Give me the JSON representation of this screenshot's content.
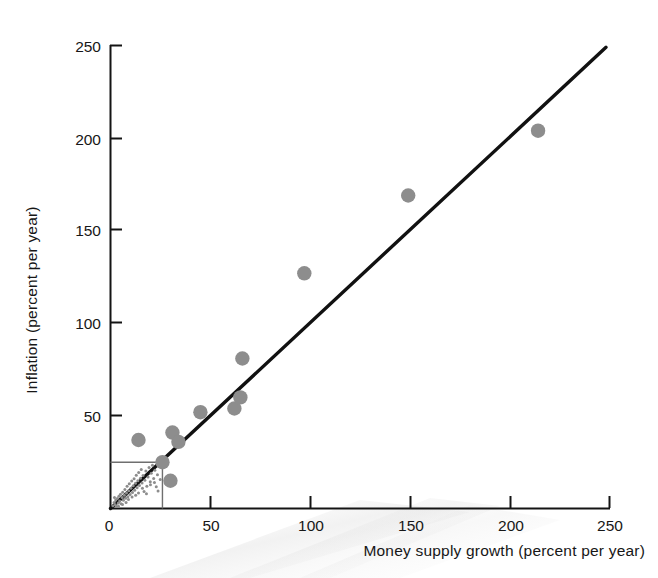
{
  "chart_data": {
    "type": "scatter",
    "title": "",
    "xlabel": "Money supply growth (percent per year)",
    "ylabel": "Inflation (percent per year)",
    "xlim": [
      0,
      250
    ],
    "ylim": [
      0,
      250
    ],
    "xticks": [
      0,
      50,
      100,
      150,
      200,
      250
    ],
    "yticks": [
      0,
      50,
      100,
      150,
      200,
      250
    ],
    "xtick_labels": [
      "0",
      "50",
      "100",
      "150",
      "200",
      "250"
    ],
    "ytick_labels": [
      "0",
      "50",
      "100",
      "150",
      "200",
      "250"
    ],
    "grid": false,
    "legend": "none",
    "series": [
      {
        "name": "Countries (large markers)",
        "marker": "circle",
        "color": "#8d8d8d",
        "points": [
          {
            "x": 14,
            "y": 37
          },
          {
            "x": 26,
            "y": 25
          },
          {
            "x": 30,
            "y": 15
          },
          {
            "x": 31,
            "y": 41
          },
          {
            "x": 34,
            "y": 36
          },
          {
            "x": 45,
            "y": 52
          },
          {
            "x": 62,
            "y": 54
          },
          {
            "x": 65,
            "y": 60
          },
          {
            "x": 66,
            "y": 81
          },
          {
            "x": 97,
            "y": 127
          },
          {
            "x": 149,
            "y": 169
          },
          {
            "x": 214,
            "y": 204
          }
        ]
      },
      {
        "name": "Inset cluster (small markers)",
        "marker": "small-dot",
        "color": "#8d8d8d",
        "points": [
          {
            "x": 1.2,
            "y": 1.5
          },
          {
            "x": 1.8,
            "y": 3.2
          },
          {
            "x": 2.4,
            "y": 2.0
          },
          {
            "x": 2.6,
            "y": 4.6
          },
          {
            "x": 3.1,
            "y": 1.1
          },
          {
            "x": 3.4,
            "y": 5.4
          },
          {
            "x": 3.9,
            "y": 3.0
          },
          {
            "x": 4.2,
            "y": 6.6
          },
          {
            "x": 4.6,
            "y": 4.1
          },
          {
            "x": 5.0,
            "y": 7.7
          },
          {
            "x": 5.3,
            "y": 2.6
          },
          {
            "x": 5.8,
            "y": 5.9
          },
          {
            "x": 6.1,
            "y": 8.8
          },
          {
            "x": 6.5,
            "y": 4.4
          },
          {
            "x": 6.9,
            "y": 7.1
          },
          {
            "x": 7.2,
            "y": 10.2
          },
          {
            "x": 7.6,
            "y": 5.6
          },
          {
            "x": 8.0,
            "y": 8.4
          },
          {
            "x": 8.3,
            "y": 12.0
          },
          {
            "x": 8.7,
            "y": 6.4
          },
          {
            "x": 9.1,
            "y": 9.6
          },
          {
            "x": 9.4,
            "y": 13.4
          },
          {
            "x": 9.8,
            "y": 7.5
          },
          {
            "x": 10.2,
            "y": 11.0
          },
          {
            "x": 10.6,
            "y": 14.8
          },
          {
            "x": 11.0,
            "y": 8.6
          },
          {
            "x": 11.4,
            "y": 12.3
          },
          {
            "x": 11.8,
            "y": 16.1
          },
          {
            "x": 12.1,
            "y": 9.9
          },
          {
            "x": 12.5,
            "y": 13.6
          },
          {
            "x": 12.9,
            "y": 18.0
          },
          {
            "x": 13.3,
            "y": 11.2
          },
          {
            "x": 13.7,
            "y": 15.0
          },
          {
            "x": 14.1,
            "y": 19.4
          },
          {
            "x": 14.5,
            "y": 12.4
          },
          {
            "x": 15.0,
            "y": 16.4
          },
          {
            "x": 15.4,
            "y": 21.0
          },
          {
            "x": 15.8,
            "y": 13.8
          },
          {
            "x": 16.3,
            "y": 17.8
          },
          {
            "x": 16.8,
            "y": 9.2
          },
          {
            "x": 17.2,
            "y": 15.2
          },
          {
            "x": 17.7,
            "y": 20.2
          },
          {
            "x": 18.2,
            "y": 12.0
          },
          {
            "x": 18.8,
            "y": 17.0
          },
          {
            "x": 19.3,
            "y": 22.2
          },
          {
            "x": 19.9,
            "y": 14.4
          },
          {
            "x": 20.4,
            "y": 19.0
          },
          {
            "x": 21.0,
            "y": 23.4
          },
          {
            "x": 21.6,
            "y": 16.2
          },
          {
            "x": 22.2,
            "y": 20.6
          },
          {
            "x": 22.9,
            "y": 11.8
          },
          {
            "x": 23.5,
            "y": 18.2
          },
          {
            "x": 24.2,
            "y": 22.8
          },
          {
            "x": 24.9,
            "y": 15.6
          },
          {
            "x": 2.0,
            "y": 6.0
          },
          {
            "x": 4.0,
            "y": 1.2
          },
          {
            "x": 6.0,
            "y": 2.2
          },
          {
            "x": 7.8,
            "y": 3.2
          },
          {
            "x": 9.0,
            "y": 4.8
          },
          {
            "x": 10.8,
            "y": 6.2
          },
          {
            "x": 12.6,
            "y": 7.2
          },
          {
            "x": 14.0,
            "y": 8.4
          },
          {
            "x": 16.0,
            "y": 11.0
          },
          {
            "x": 18.0,
            "y": 8.0
          },
          {
            "x": 20.0,
            "y": 12.8
          },
          {
            "x": 22.0,
            "y": 14.0
          },
          {
            "x": 23.8,
            "y": 9.4
          }
        ]
      }
    ],
    "trendline": {
      "x0": 0,
      "y0": 0,
      "x1": 248,
      "y1": 249,
      "color": "#111111"
    },
    "inset_box": {
      "x0": 0,
      "y0": 0,
      "x1": 26,
      "y1": 25,
      "color": "#6f6f6f"
    }
  }
}
